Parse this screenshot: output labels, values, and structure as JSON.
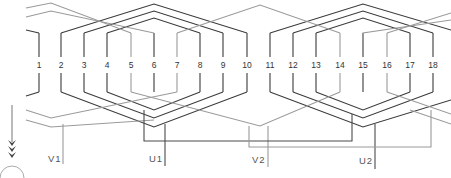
{
  "diagram": {
    "title": "",
    "slots": [
      {
        "n": "1",
        "x": 39
      },
      {
        "n": "2",
        "x": 61
      },
      {
        "n": "3",
        "x": 84
      },
      {
        "n": "4",
        "x": 107
      },
      {
        "n": "5",
        "x": 131
      },
      {
        "n": "6",
        "x": 154
      },
      {
        "n": "7",
        "x": 177
      },
      {
        "n": "8",
        "x": 200
      },
      {
        "n": "9",
        "x": 223
      },
      {
        "n": "10",
        "x": 247
      },
      {
        "n": "11",
        "x": 270
      },
      {
        "n": "12",
        "x": 293
      },
      {
        "n": "13",
        "x": 316
      },
      {
        "n": "14",
        "x": 340
      },
      {
        "n": "15",
        "x": 363
      },
      {
        "n": "16",
        "x": 387
      },
      {
        "n": "17",
        "x": 410
      },
      {
        "n": "18",
        "x": 433
      }
    ],
    "terminals": [
      {
        "label": "V1",
        "x": 63,
        "phase": "V"
      },
      {
        "label": "U1",
        "x": 165,
        "phase": "U"
      },
      {
        "label": "V2",
        "x": 268,
        "phase": "V"
      },
      {
        "label": "U2",
        "x": 375,
        "phase": "U"
      }
    ],
    "colors": {
      "phase_u": "#3a3a3a",
      "phase_v": "#9a9a9a"
    },
    "rotation_indicator": {
      "arrows": 3,
      "symbol": "arrow-down"
    }
  }
}
